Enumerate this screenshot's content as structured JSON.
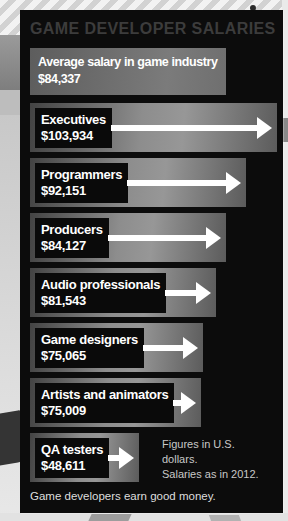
{
  "page": {
    "title": "GAME DEVELOPER SALARIES",
    "footer": "Game developers earn good money.",
    "note_line1": "Figures in U.S. dollars.",
    "note_line2": "Salaries as in 2012."
  },
  "average": {
    "label": "Average salary in game industry",
    "salary": "$84,337",
    "bar_width": 196
  },
  "rows": [
    {
      "label": "Executives",
      "salary": "$103,934",
      "bar_width": 247
    },
    {
      "label": "Programmers",
      "salary": "$92,151",
      "bar_width": 216
    },
    {
      "label": "Producers",
      "salary": "$84,127",
      "bar_width": 196
    },
    {
      "label": "Audio professionals",
      "salary": "$81,543",
      "bar_width": 186
    },
    {
      "label": "Game designers",
      "salary": "$75,065",
      "bar_width": 173
    },
    {
      "label": "Artists and animators",
      "salary": "$75,009",
      "bar_width": 171
    },
    {
      "label": "QA testers",
      "salary": "$48,611",
      "bar_width": 109
    }
  ],
  "chart_data": {
    "type": "bar",
    "orientation": "horizontal",
    "title": "GAME DEVELOPER SALARIES",
    "categories": [
      "Executives",
      "Programmers",
      "Producers",
      "Audio professionals",
      "Game designers",
      "Artists and animators",
      "QA testers"
    ],
    "values": [
      103934,
      92151,
      84127,
      81543,
      75065,
      75009,
      48611
    ],
    "average": {
      "label": "Average salary in game industry",
      "value": 84337
    },
    "unit": "U.S. dollars",
    "xlim": [
      0,
      110000
    ],
    "grid": false,
    "legend": false,
    "notes": [
      "Figures in U.S. dollars.",
      "Salaries as in 2012."
    ],
    "caption": "Game developers earn good money."
  },
  "colors": {
    "panel_bg": "#0c0c0c",
    "bar_gradient_dark": "#434343",
    "bar_gradient_light": "#979797",
    "label_box_bg": "#0a0a0a",
    "arrow": "#ffffff",
    "title_text": "#3c3c3c",
    "label_text": "#ffffff",
    "note_text": "#c8c8c8",
    "footer_text": "#dedede",
    "page_bg": "#cdcdcd"
  }
}
